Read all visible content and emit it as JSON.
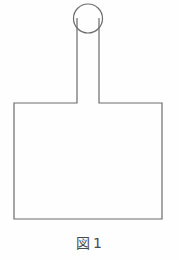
{
  "figure": {
    "caption_label": "図",
    "caption_number": "1",
    "caption_full": "図 1",
    "stroke_color": "#6b6b6b",
    "background_color": "#fefefe",
    "fill_color": "none",
    "stroke_width": 1.2,
    "shapes": {
      "circle": {
        "name": "bulb-circle",
        "cx": 88,
        "cy": 18.5,
        "r": 14.5
      },
      "neck": {
        "name": "neck-rectangle",
        "x_left": 77,
        "x_right": 99,
        "y_top": 18,
        "y_bottom": 103
      },
      "body": {
        "name": "body-rectangle",
        "x_left": 14,
        "x_right": 162,
        "y_top": 103,
        "y_bottom": 219
      }
    },
    "outline_path": "M 77 18 L 77 103 L 14 103 L 14 219 L 162 219 L 162 103 L 99 103 L 99 18"
  }
}
